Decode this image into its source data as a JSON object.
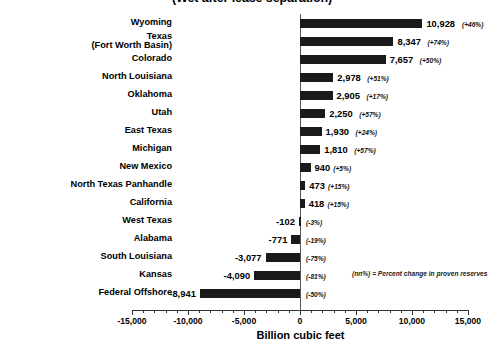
{
  "chart_data": {
    "type": "bar",
    "orientation": "horizontal",
    "title": "(Wet after lease separation)",
    "xlabel": "Billion cubic feet",
    "ylabel": "",
    "xlim": [
      -15000,
      15000
    ],
    "xticks": [
      "-15,000",
      "-10,000",
      "-5,000",
      "0",
      "5,000",
      "10,000",
      "15,000"
    ],
    "xtick_values": [
      -15000,
      -10000,
      -5000,
      0,
      5000,
      10000,
      15000
    ],
    "grid": false,
    "legend": "",
    "annotation": "(nn%) = Percent change in proven reserves",
    "bar_color": "#1a1a1a",
    "categories": [
      "Wyoming",
      "Texas\n(Fort Worth Basin)",
      "Colorado",
      "North Louisiana",
      "Oklahoma",
      "Utah",
      "East Texas",
      "Michigan",
      "New Mexico",
      "North Texas Panhandle",
      "California",
      "West Texas",
      "Alabama",
      "South Louisiana",
      "Kansas",
      "Federal Offshore"
    ],
    "values": [
      10928,
      8347,
      7657,
      2978,
      2905,
      2250,
      1930,
      1810,
      940,
      473,
      418,
      -102,
      -771,
      -3077,
      -4090,
      -8941
    ],
    "value_labels": [
      "10,928",
      "8,347",
      "7,657",
      "2,978",
      "2,905",
      "2,250",
      "1,930",
      "1,810",
      "940",
      "473",
      "418",
      "-102",
      "-771",
      "-3,077",
      "-4,090",
      "-8,941"
    ],
    "percent_labels": [
      "(+46%)",
      "(+74%)",
      "(+50%)",
      "(+51%)",
      "(+17%)",
      "(+57%)",
      "(+24%)",
      "(+57%)",
      "(+5%)",
      "(+15%)",
      "(+15%)",
      "(-3%)",
      "(-19%)",
      "(-75%)",
      "(-81%)",
      "(-50%)"
    ]
  }
}
